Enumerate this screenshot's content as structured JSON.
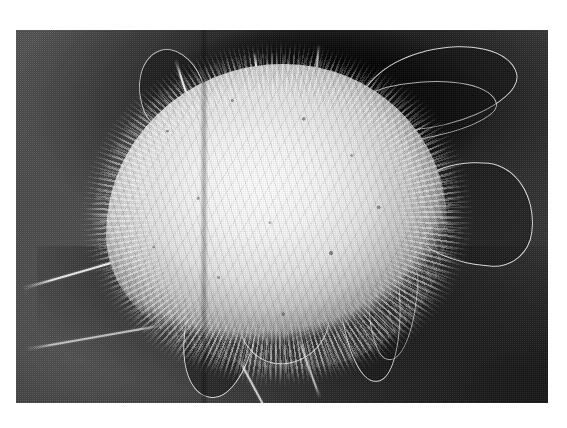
{
  "page": {
    "background_color": "#ffffff",
    "width": 567,
    "height": 428,
    "caption": ""
  },
  "figure": {
    "name": "scanning-electron-micrograph",
    "kind": "grayscale halftone photographic plate",
    "plate": {
      "left": 16,
      "top": 30,
      "width": 532,
      "height": 373,
      "background_color": "#4c4c4c",
      "darkest_color": "#141414",
      "brightest_color": "#f2f2f2",
      "border": "none"
    },
    "features": [
      {
        "id": "cell-body",
        "label": "cell body / dome",
        "tone": "bright",
        "position": "centre-left"
      },
      {
        "id": "ruffles",
        "label": "ruffled membrane spikes",
        "tone": "bright",
        "position": "rim of cell body"
      },
      {
        "id": "veil-ur",
        "label": "upper-right lamellipodial veil",
        "tone": "dark with bright margin",
        "position": "upper right"
      },
      {
        "id": "veil-ur2",
        "label": "second upper-right veil",
        "tone": "dark with bright margin",
        "position": "upper right"
      },
      {
        "id": "veil-r",
        "label": "right curved veil",
        "tone": "dark with bright margin",
        "position": "right"
      },
      {
        "id": "veil-lr",
        "label": "lower-right finger process",
        "tone": "dark with bright margin",
        "position": "lower right"
      },
      {
        "id": "veil-lr2",
        "label": "second lower-right finger",
        "tone": "dark with bright margin",
        "position": "lower right"
      },
      {
        "id": "veil-b1",
        "label": "bottom loop process",
        "tone": "dark with bright margin",
        "position": "bottom centre"
      },
      {
        "id": "veil-b2",
        "label": "bottom triangular veil",
        "tone": "dark with bright margin",
        "position": "bottom centre"
      },
      {
        "id": "veil-ul",
        "label": "upper-left veil",
        "tone": "dark with bright margin",
        "position": "upper left"
      },
      {
        "id": "filopodium-left",
        "label": "long left filopodium",
        "tone": "bright filament",
        "position": "extends to lower left"
      },
      {
        "id": "filopodium-left2",
        "label": "second left filament",
        "tone": "bright filament",
        "position": "lower left"
      },
      {
        "id": "filopodia-top",
        "label": "apical filopodia",
        "tone": "bright filaments",
        "position": "top"
      },
      {
        "id": "filopodia-bottom",
        "label": "basal filopodia",
        "tone": "bright filaments",
        "position": "bottom"
      },
      {
        "id": "scan-artifact",
        "label": "vertical scan band artefact",
        "tone": "dark stripe",
        "position": "left third, full height"
      }
    ],
    "print": {
      "halftone": "visible dot dither",
      "grain": "coarse",
      "color_mode": "grayscale"
    }
  }
}
